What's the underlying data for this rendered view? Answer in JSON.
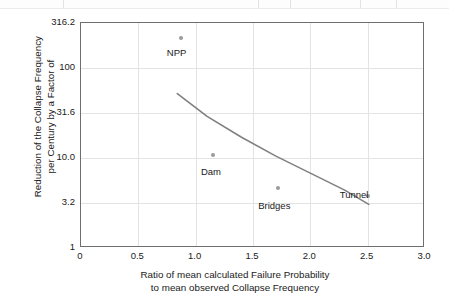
{
  "chart_data": {
    "type": "scatter",
    "title": "",
    "xlabel": "Ratio of mean calculated Failure Probability to mean observed Collapse Frequency",
    "xlabel_line1": "Ratio of mean calculated Failure Probability",
    "xlabel_line2": "to mean observed Collapse Frequency",
    "ylabel": "Reduction of the Collapse Frequency per Century by a Factor of",
    "ylabel_line1": "Reduction of the Collapse Frequency",
    "ylabel_line2": "per Century by a Factor of",
    "xlim": [
      0,
      3.0
    ],
    "ylim": [
      1,
      316.2
    ],
    "yscale": "log",
    "xscale": "linear",
    "grid": true,
    "legend": "none",
    "xticks": [
      0,
      0.5,
      1.0,
      1.5,
      2.0,
      2.5,
      3.0
    ],
    "xtick_labels": [
      "0",
      "0.5",
      "1.0",
      "1.5",
      "2.0",
      "2.5",
      "3.0"
    ],
    "yticks": [
      1,
      3.2,
      10.0,
      31.6,
      100,
      316.2
    ],
    "ytick_labels": [
      "1",
      "3.2",
      "10.0",
      "31.6",
      "100",
      "316.2"
    ],
    "points": [
      {
        "label": "NPP",
        "x": 0.87,
        "y": 215.0,
        "label_dx": -14,
        "label_dy": 10
      },
      {
        "label": "Dam",
        "x": 1.15,
        "y": 10.8,
        "label_dx": -12,
        "label_dy": 12
      },
      {
        "label": "Bridges",
        "x": 1.72,
        "y": 4.6,
        "label_dx": -20,
        "label_dy": 13
      },
      {
        "label": "Tunnel",
        "x": 2.5,
        "y": 3.8,
        "label_dx": -28,
        "label_dy": -6
      }
    ],
    "trend_curve": {
      "name": "fitted trend",
      "x": [
        0.84,
        1.1,
        1.4,
        1.7,
        2.0,
        2.3,
        2.51
      ],
      "y": [
        52.0,
        29.0,
        17.0,
        10.5,
        6.8,
        4.4,
        3.05
      ]
    },
    "colors": {
      "marker": "#9a9a9a",
      "curve": "#808080",
      "grid": "#e3e3e3",
      "frame": "#6f6f6f",
      "text": "#1a1a1a",
      "background": "#ffffff"
    }
  }
}
